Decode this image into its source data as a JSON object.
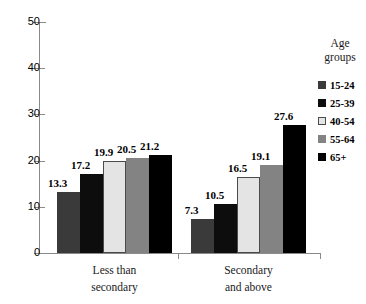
{
  "chart_data": {
    "type": "bar",
    "title": "",
    "xlabel": "",
    "ylabel": "",
    "ylim": [
      0,
      50
    ],
    "ytick_step": 10,
    "yticks": [
      "0",
      "10",
      "20",
      "30",
      "40",
      "50"
    ],
    "grid": false,
    "legend_position": "right",
    "legend_title_lines": [
      "Age",
      "groups"
    ],
    "categories": [
      "Less than secondary",
      "Secondary and above"
    ],
    "category_label_lines": [
      [
        "Less than",
        "secondary"
      ],
      [
        "Secondary",
        "and above"
      ]
    ],
    "series": [
      {
        "name": "15-24",
        "color": "#3a3a3a",
        "values": [
          13.3,
          7.3
        ]
      },
      {
        "name": "25-39",
        "color": "#0d0d0d",
        "values": [
          17.2,
          10.5
        ]
      },
      {
        "name": "40-54",
        "color": "#e4e4e4",
        "values": [
          19.9,
          16.5
        ]
      },
      {
        "name": "55-64",
        "color": "#838383",
        "values": [
          20.5,
          19.1
        ]
      },
      {
        "name": "65+",
        "color": "#000000",
        "values": [
          21.2,
          27.6
        ]
      }
    ],
    "data_labels": [
      [
        "13.3",
        "17.2",
        "19.9",
        "20.5",
        "21.2"
      ],
      [
        "7.3",
        "10.5",
        "16.5",
        "19.1",
        "27.6"
      ]
    ]
  }
}
